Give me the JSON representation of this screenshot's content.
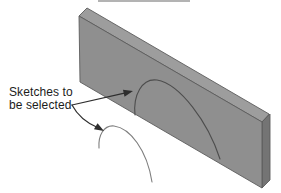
{
  "figure": {
    "type": "cad-isometric-illustration",
    "label": {
      "line1": "Sketches to",
      "line2": "be selected",
      "full_text": "Sketches to be selected"
    },
    "colors": {
      "background": "#ffffff",
      "plate_top_face": "#9d9d9d",
      "plate_front_face": "#8f8f8f",
      "plate_side_face": "#747474",
      "sketch_arc_on_plate": "#4d4d4d",
      "sketch_arc_floating": "#7e7e7e",
      "arrow": "#2e2e2e",
      "label_text": "#1c1c1c",
      "scan_artifact_line": "#9a9a9a"
    }
  }
}
